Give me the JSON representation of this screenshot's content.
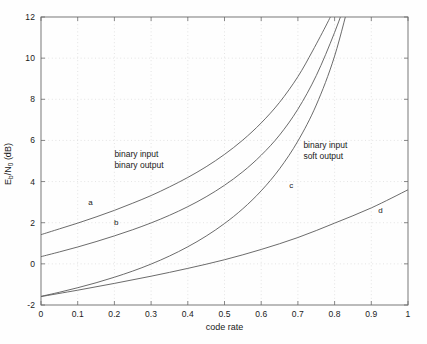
{
  "chart_data": {
    "type": "line",
    "title": "",
    "xlabel": "code rate",
    "ylabel": "E_b/N_0 (dB)",
    "xlim": [
      0,
      1
    ],
    "ylim": [
      -2,
      12
    ],
    "grid": "dotted",
    "legend_position": "inline-annotations",
    "xticks": [
      "0",
      "0.1",
      "0.2",
      "0.3",
      "0.4",
      "0.5",
      "0.6",
      "0.7",
      "0.8",
      "0.9",
      "1"
    ],
    "xtick_values": [
      0,
      0.1,
      0.2,
      0.3,
      0.4,
      0.5,
      0.6,
      0.7,
      0.8,
      0.9,
      1
    ],
    "yticks": [
      "-2",
      "0",
      "2",
      "4",
      "6",
      "8",
      "10",
      "12"
    ],
    "ytick_values": [
      -2,
      0,
      2,
      4,
      6,
      8,
      10,
      12
    ],
    "annotations": [
      {
        "name": "binary-input-binary-output",
        "line1": "binary input",
        "line2": "binary output",
        "x": 0.2,
        "y": 5.6
      },
      {
        "name": "binary-input-soft-output",
        "line1": "binary input",
        "line2": "soft output",
        "x": 0.715,
        "y": 6.0
      }
    ],
    "series": [
      {
        "name": "a",
        "label": "a",
        "label_x": 0.135,
        "label_y": 3.0,
        "x": [
          0.0,
          0.05,
          0.1,
          0.15,
          0.2,
          0.25,
          0.3,
          0.35,
          0.4,
          0.45,
          0.5,
          0.55,
          0.6,
          0.65,
          0.7,
          0.74,
          0.78,
          0.8,
          0.82,
          0.84,
          0.85
        ],
        "y": [
          1.42,
          1.7,
          1.98,
          2.28,
          2.6,
          2.95,
          3.32,
          3.74,
          4.2,
          4.72,
          5.32,
          6.02,
          6.85,
          7.85,
          9.1,
          10.35,
          11.7,
          12.45,
          13.3,
          14.3,
          14.9
        ]
      },
      {
        "name": "b",
        "label": "b",
        "label_x": 0.205,
        "label_y": 2.05,
        "x": [
          0.0,
          0.05,
          0.1,
          0.15,
          0.2,
          0.25,
          0.3,
          0.35,
          0.4,
          0.45,
          0.5,
          0.55,
          0.6,
          0.65,
          0.7,
          0.75,
          0.8,
          0.84,
          0.87,
          0.89,
          0.9
        ],
        "y": [
          0.35,
          0.58,
          0.82,
          1.08,
          1.36,
          1.66,
          1.99,
          2.36,
          2.78,
          3.26,
          3.82,
          4.48,
          5.28,
          6.26,
          7.52,
          9.15,
          11.25,
          13.2,
          14.6,
          15.6,
          16.1
        ]
      },
      {
        "name": "c",
        "label": "c",
        "label_x": 0.682,
        "label_y": 3.85,
        "x": [
          0.0,
          0.05,
          0.1,
          0.15,
          0.2,
          0.25,
          0.3,
          0.35,
          0.4,
          0.45,
          0.5,
          0.55,
          0.6,
          0.65,
          0.7,
          0.75,
          0.8,
          0.85,
          0.89,
          0.92,
          0.94
        ],
        "y": [
          -1.58,
          -1.38,
          -1.16,
          -0.92,
          -0.65,
          -0.35,
          -0.01,
          0.38,
          0.83,
          1.35,
          1.96,
          2.68,
          3.55,
          4.62,
          5.97,
          7.72,
          10.1,
          13.4,
          15.8,
          17.4,
          18.4
        ]
      },
      {
        "name": "d",
        "label": "d",
        "label_x": 0.925,
        "label_y": 2.62,
        "x": [
          0.0,
          0.1,
          0.2,
          0.3,
          0.4,
          0.5,
          0.6,
          0.7,
          0.8,
          0.9,
          1.0
        ],
        "y": [
          -1.59,
          -1.28,
          -0.95,
          -0.6,
          -0.22,
          0.2,
          0.7,
          1.28,
          1.98,
          2.72,
          3.6
        ]
      }
    ]
  },
  "figure": {
    "background_color": "#fefefe",
    "axis_color": "#6b6b6b",
    "grid_color": "#d9d9d9",
    "curve_color": "#5a5a5a",
    "text_color": "#1a1a1a"
  }
}
